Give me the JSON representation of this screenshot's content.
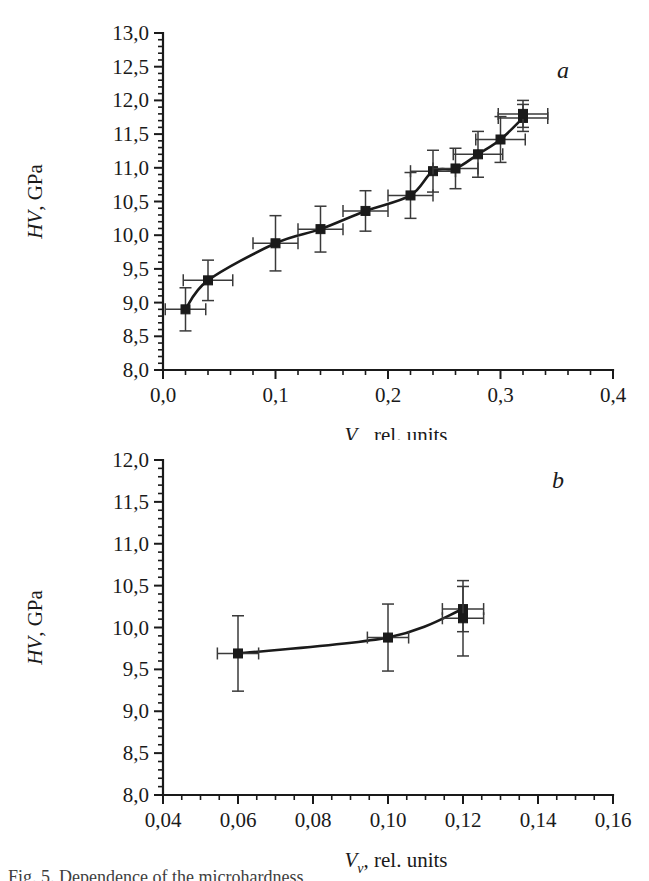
{
  "figure": {
    "background_color": "#ffffff",
    "ink_color": "#1a1a1a",
    "caption_fragment": "Fig. 5. Dependence of the microhardness"
  },
  "chart_data": [
    {
      "type": "line",
      "panel_label": "a",
      "title": "",
      "xlabel": "V_v, rel. units",
      "xlabel_parts": {
        "symbol": "V",
        "subscript": "v",
        "rest": ", rel. units"
      },
      "ylabel": "HV, GPa",
      "ylabel_parts": {
        "symbol": "HV",
        "rest": ", GPa"
      },
      "xlim": [
        0.0,
        0.4
      ],
      "ylim": [
        8.0,
        13.0
      ],
      "xticks": [
        0.0,
        0.1,
        0.2,
        0.3,
        0.4
      ],
      "xticklabels": [
        "0,0",
        "0,1",
        "0,2",
        "0,3",
        "0,4"
      ],
      "x_minor_step": 0.02,
      "yticks": [
        8.0,
        8.5,
        9.0,
        9.5,
        10.0,
        10.5,
        11.0,
        11.5,
        12.0,
        12.5,
        13.0
      ],
      "yticklabels": [
        "8,0",
        "8,5",
        "9,0",
        "9,5",
        "10,0",
        "10,5",
        "11,0",
        "11,5",
        "12,0",
        "12,5",
        "13,0"
      ],
      "y_minor_step": 0.1,
      "grid": false,
      "legend": "none",
      "marker": "filled-square",
      "x": [
        0.02,
        0.04,
        0.1,
        0.14,
        0.18,
        0.22,
        0.24,
        0.26,
        0.28,
        0.3,
        0.32,
        0.32
      ],
      "y": [
        8.9,
        9.33,
        9.88,
        10.09,
        10.36,
        10.59,
        10.95,
        10.99,
        11.2,
        11.42,
        11.74,
        11.8
      ],
      "xerr": [
        0.018,
        0.022,
        0.02,
        0.02,
        0.02,
        0.02,
        0.02,
        0.02,
        0.022,
        0.022,
        0.022,
        0.022
      ],
      "yerr": [
        0.32,
        0.3,
        0.41,
        0.34,
        0.3,
        0.34,
        0.31,
        0.3,
        0.34,
        0.34,
        0.2,
        0.2
      ]
    },
    {
      "type": "line",
      "panel_label": "b",
      "title": "",
      "xlabel": "V_v, rel. units",
      "xlabel_parts": {
        "symbol": "V",
        "subscript": "v",
        "rest": ", rel. units"
      },
      "ylabel": "HV, GPa",
      "ylabel_parts": {
        "symbol": "HV",
        "rest": ", GPa"
      },
      "xlim": [
        0.04,
        0.16
      ],
      "ylim": [
        8.0,
        12.0
      ],
      "xticks": [
        0.04,
        0.06,
        0.08,
        0.1,
        0.12,
        0.14,
        0.16
      ],
      "xticklabels": [
        "0,04",
        "0,06",
        "0,08",
        "0,10",
        "0,12",
        "0,14",
        "0,16"
      ],
      "x_minor_step": 0.005,
      "yticks": [
        8.0,
        8.5,
        9.0,
        9.5,
        10.0,
        10.5,
        11.0,
        11.5,
        12.0
      ],
      "yticklabels": [
        "8,0",
        "8,5",
        "9,0",
        "9,5",
        "10,0",
        "10,5",
        "11,0",
        "11,5",
        "12,0"
      ],
      "y_minor_step": 0.1,
      "grid": false,
      "legend": "none",
      "marker": "filled-square",
      "x": [
        0.06,
        0.1,
        0.12,
        0.12
      ],
      "y": [
        9.69,
        9.88,
        10.22,
        10.11
      ],
      "xerr": [
        0.0055,
        0.0055,
        0.0055,
        0.0055
      ],
      "yerr": [
        0.45,
        0.4,
        0.27,
        0.45
      ]
    }
  ]
}
